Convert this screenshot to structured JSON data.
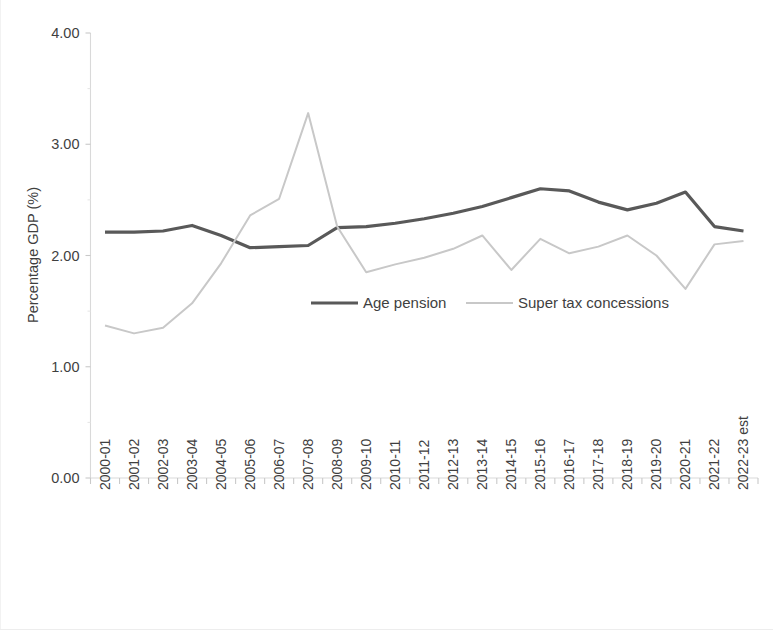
{
  "chart_data": {
    "type": "line",
    "title": "",
    "xlabel": "",
    "ylabel": "Percentage GDP (%)",
    "ylim": [
      0.0,
      4.0
    ],
    "yticks": [
      "0.00",
      "1.00",
      "2.00",
      "3.00",
      "4.00"
    ],
    "ytick_values": [
      0.0,
      1.0,
      2.0,
      3.0,
      4.0
    ],
    "grid": false,
    "legend_position": "center",
    "categories": [
      "2000-01",
      "2001-02",
      "2002-03",
      "2003-04",
      "2004-05",
      "2005-06",
      "2006-07",
      "2007-08",
      "2008-09",
      "2009-10",
      "2010-11",
      "2011-12",
      "2012-13",
      "2013-14",
      "2014-15",
      "2015-16",
      "2016-17",
      "2017-18",
      "2018-19",
      "2019-20",
      "2020-21",
      "2021-22",
      "2022-23 est"
    ],
    "series": [
      {
        "name": "Age pension",
        "color": "#595959",
        "width": 3.2,
        "values": [
          2.21,
          2.21,
          2.22,
          2.27,
          2.18,
          2.07,
          2.08,
          2.09,
          2.25,
          2.26,
          2.29,
          2.33,
          2.38,
          2.44,
          2.52,
          2.6,
          2.58,
          2.48,
          2.41,
          2.47,
          2.57,
          2.26,
          2.22
        ]
      },
      {
        "name": "Super tax concessions",
        "color": "#c8c8c8",
        "width": 2.0,
        "values": [
          1.37,
          1.3,
          1.35,
          1.57,
          1.93,
          2.36,
          2.51,
          3.28,
          2.26,
          1.85,
          1.92,
          1.98,
          2.06,
          2.18,
          1.87,
          2.15,
          2.02,
          2.08,
          2.18,
          2.0,
          1.7,
          2.1,
          2.13
        ]
      }
    ],
    "legend_entries": [
      {
        "label": "Age pension",
        "color": "#595959"
      },
      {
        "label": "Super tax concessions",
        "color": "#c8c8c8"
      }
    ]
  }
}
